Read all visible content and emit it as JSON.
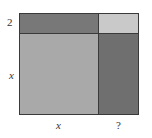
{
  "diagram": {
    "title": "",
    "regions": [
      {
        "id": "top-left",
        "name": "2x-rectangle",
        "color": "#787878"
      },
      {
        "id": "top-right",
        "name": "small-square",
        "color": "#c9c9c9"
      },
      {
        "id": "bottom-left",
        "name": "x-squared-square",
        "color": "#a9a9a9"
      },
      {
        "id": "bottom-right",
        "name": "x-by-unknown-rectangle",
        "color": "#6f6f6f"
      }
    ],
    "labels": {
      "left_top": "2",
      "left_bottom": "x",
      "bottom_left": "x",
      "bottom_right": "?"
    },
    "border_color": "#3a3a3a"
  }
}
